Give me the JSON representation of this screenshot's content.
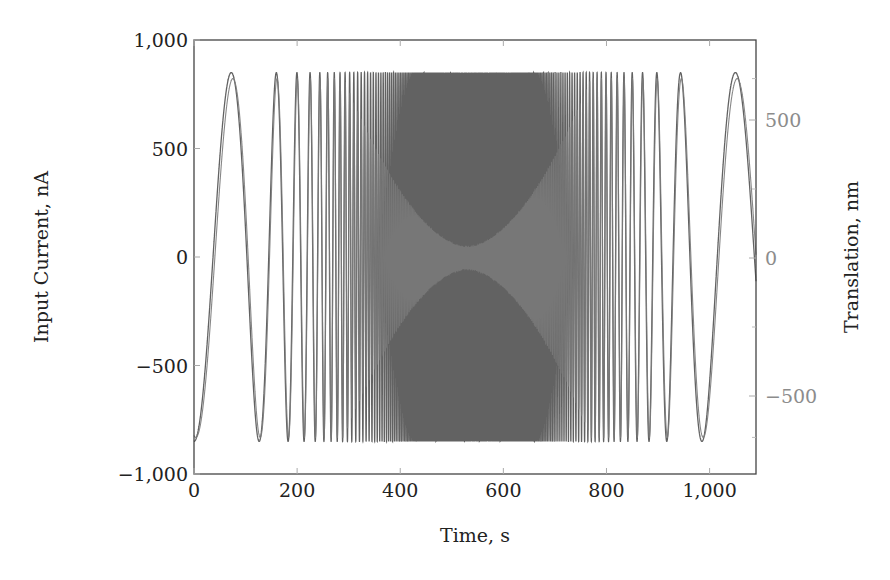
{
  "chart_data": {
    "type": "line",
    "title": "",
    "xlabel": "Time, s",
    "ylabel": "Input Current, nA",
    "y2label": "Translation, nm",
    "xlim": [
      0,
      1090
    ],
    "ylim": [
      -1000,
      1000
    ],
    "y2lim": [
      -720,
      720
    ],
    "x_ticks": [
      0,
      200,
      400,
      600,
      800,
      1000
    ],
    "x_tick_labels": [
      "0",
      "200",
      "400",
      "600",
      "800",
      "1,000"
    ],
    "y_ticks": [
      -1000,
      -500,
      0,
      500,
      1000
    ],
    "y_tick_labels": [
      "−1,000",
      "−500",
      "0",
      "500",
      "1,000"
    ],
    "y2_ticks": [
      -500,
      0,
      500
    ],
    "y2_tick_labels": [
      "−500",
      "0",
      "500"
    ],
    "y2_minor_ticks": [
      -650,
      -250,
      250,
      650
    ],
    "grid": false,
    "legend": null,
    "series": [
      {
        "name": "Input Current (chirp)",
        "axis": "left",
        "description": "Symmetric frequency chirp, amplitude ~850 nA; low frequency at both ends, very dense between ~290 s and ~720 s",
        "amplitude": 850,
        "color": "#5a5a5a",
        "peak_times_s": [
          74,
          138,
          171,
          194,
          211,
          227,
          925,
          1025
        ],
        "trough_times_s": [
          0,
          112,
          985,
          1090
        ]
      },
      {
        "name": "Translation response",
        "axis": "right",
        "description": "Response follows input at low frequency; amplitude collapses near ~530 s forming an hourglass envelope (min ~40 nm)",
        "amplitude_max": 650,
        "amplitude_min_at_s": 530,
        "color": "#7a7a7a"
      }
    ]
  },
  "axes": {
    "xlabel": "Time, s",
    "ylabel": "Input Current, nA",
    "y2label": "Translation, nm"
  }
}
